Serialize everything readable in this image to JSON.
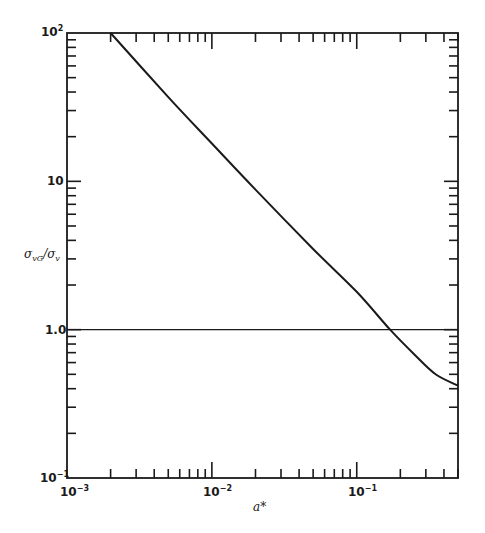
{
  "chart_data": {
    "type": "line",
    "title": "",
    "xlabel": "a*",
    "ylabel": "σ_vG/σ_v",
    "xscale": "log",
    "yscale": "log",
    "xlim": [
      0.001,
      0.5
    ],
    "ylim": [
      0.1,
      100
    ],
    "x_ticks": [
      "10^-3",
      "10^-2",
      "10^-1"
    ],
    "y_ticks": [
      "10^-1",
      "1.0",
      "10",
      "10^2"
    ],
    "grid": false,
    "legend": null,
    "series": [
      {
        "name": "σ_vG/σ_v vs a*",
        "x": [
          0.002,
          0.005,
          0.01,
          0.02,
          0.05,
          0.1,
          0.17,
          0.25,
          0.35,
          0.5
        ],
        "y": [
          100,
          37,
          18,
          8.8,
          3.5,
          1.8,
          1.0,
          0.68,
          0.5,
          0.42
        ]
      },
      {
        "name": "reference line y=1.0",
        "x": [
          0.001,
          0.5
        ],
        "y": [
          1.0,
          1.0
        ]
      }
    ]
  },
  "labels": {
    "x_tick_1": "10",
    "x_tick_1_exp": "−3",
    "x_tick_2": "10",
    "x_tick_2_exp": "−2",
    "x_tick_3": "10",
    "x_tick_3_exp": "−1",
    "y_tick_1": "10",
    "y_tick_1_exp": "−1",
    "y_tick_2": "1.0",
    "y_tick_3": "10",
    "y_tick_4": "10",
    "y_tick_4_exp": "2",
    "xlabel": "a*",
    "ylabel_main": "σ",
    "ylabel_sub1": "vG",
    "ylabel_slash": "/σ",
    "ylabel_sub2": "v"
  },
  "colors": {
    "ink": "#1a1a1a",
    "background": "#ffffff"
  }
}
